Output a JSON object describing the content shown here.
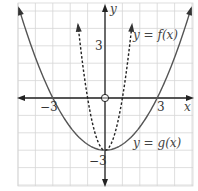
{
  "chart_data": {
    "type": "line",
    "title": "",
    "xlabel": "x",
    "ylabel": "y",
    "xlim": [
      -5.5,
      5.5
    ],
    "ylim": [
      -5.5,
      5.5
    ],
    "grid": true,
    "grid_step": 1,
    "x_ticks_labeled": [
      {
        "value": -3,
        "label": "−3"
      },
      {
        "value": 3,
        "label": "3"
      }
    ],
    "y_ticks_labeled": [
      {
        "value": 3,
        "label": "3"
      },
      {
        "value": -3,
        "label": "−3"
      }
    ],
    "series": [
      {
        "name": "y = f(x)",
        "style": "dashed",
        "equation": "f(x) = 3x^2 - 3",
        "x": [
          -1.5,
          -1,
          -0.5,
          0,
          0.5,
          1,
          1.5
        ],
        "values": [
          3.75,
          0,
          -2.25,
          -3,
          -2.25,
          0,
          3.75
        ],
        "arrows": "both ends"
      },
      {
        "name": "y = g(x)",
        "style": "solid",
        "equation": "g(x) = x^2/3 - 3",
        "x": [
          -5,
          -4,
          -3,
          -2,
          -1,
          0,
          1,
          2,
          3,
          4,
          5
        ],
        "values": [
          5.33,
          2.33,
          0,
          -1.67,
          -2.67,
          -3,
          -2.67,
          -1.67,
          0,
          2.33,
          5.33
        ],
        "arrows": "both ends"
      }
    ],
    "annotations": [
      {
        "text": "y = f(x)",
        "near": [
          3.2,
          3.3
        ]
      },
      {
        "text": "y = g(x)",
        "near": [
          3.2,
          -2.5
        ]
      },
      {
        "text": "open circle at origin",
        "point": [
          0,
          0
        ]
      }
    ]
  },
  "labels": {
    "x_axis": "x",
    "y_axis": "y",
    "x_neg3": "−3",
    "x_pos3": "3",
    "y_pos3": "3",
    "y_neg3": "−3",
    "f_label": "y = f(x)",
    "g_label": "y = g(x)"
  }
}
